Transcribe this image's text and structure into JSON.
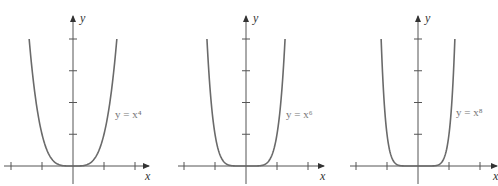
{
  "chart_data": [
    {
      "type": "line",
      "title": "",
      "function": "y = x^4",
      "annotation": "y = x⁴",
      "exponent": 4,
      "xlabel": "x",
      "ylabel": "y",
      "xlim": [
        -2.2,
        2.4
      ],
      "ylim": [
        0,
        4.7
      ],
      "x_ticks": [
        -2,
        -1,
        1,
        2
      ],
      "y_ticks": [
        1,
        2,
        3,
        4
      ],
      "x_range_plotted": [
        -1.414,
        1.414
      ],
      "grid": false
    },
    {
      "type": "line",
      "title": "",
      "function": "y = x^6",
      "annotation": "y = x⁶",
      "exponent": 6,
      "xlabel": "x",
      "ylabel": "y",
      "xlim": [
        -2.2,
        2.4
      ],
      "ylim": [
        0,
        4.7
      ],
      "x_ticks": [
        -2,
        -1,
        1,
        2
      ],
      "y_ticks": [
        1,
        2,
        3,
        4
      ],
      "x_range_plotted": [
        -1.26,
        1.26
      ],
      "grid": false
    },
    {
      "type": "line",
      "title": "",
      "function": "y = x^8",
      "annotation": "y = x⁸",
      "exponent": 8,
      "xlabel": "x",
      "ylabel": "y",
      "xlim": [
        -2.2,
        2.4
      ],
      "ylim": [
        0,
        4.7
      ],
      "x_ticks": [
        -2,
        -1,
        1,
        2
      ],
      "y_ticks": [
        1,
        2,
        3,
        4
      ],
      "x_range_plotted": [
        -1.19,
        1.19
      ],
      "grid": false
    }
  ],
  "labels": {
    "x": "x",
    "y": "y",
    "eq1": "y = x⁴",
    "eq2": "y = x⁶",
    "eq3": "y = x⁸"
  },
  "colors": {
    "axis": "#555555",
    "curve": "#6a6a6a"
  }
}
